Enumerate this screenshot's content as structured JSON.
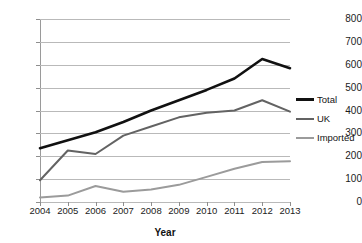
{
  "chart_data": {
    "type": "line",
    "title": "",
    "xlabel": "Year",
    "ylabel": "",
    "grid": true,
    "legend_position": "right",
    "categories": [
      "2004",
      "2005",
      "2006",
      "2007",
      "2008",
      "2009",
      "2010",
      "2011",
      "2012",
      "2013"
    ],
    "x": [
      2004,
      2005,
      2006,
      2007,
      2008,
      2009,
      2010,
      2011,
      2012,
      2013
    ],
    "ylim": [
      0,
      800
    ],
    "yticks": [
      0,
      100,
      200,
      300,
      400,
      500,
      600,
      700,
      800
    ],
    "xticks": [
      "2004",
      "2005",
      "2006",
      "2007",
      "2008",
      "2009",
      "2010",
      "2011",
      "2012",
      "2013"
    ],
    "series": [
      {
        "name": "Total",
        "color": "#111111",
        "width": 2.6,
        "values": [
          235,
          270,
          305,
          350,
          400,
          445,
          490,
          540,
          625,
          585
        ]
      },
      {
        "name": "UK",
        "color": "#636363",
        "width": 2.0,
        "values": [
          95,
          225,
          210,
          290,
          330,
          370,
          390,
          400,
          445,
          395
        ]
      },
      {
        "name": "Imported",
        "color": "#9b9b9b",
        "width": 2.0,
        "values": [
          20,
          28,
          70,
          45,
          55,
          75,
          110,
          145,
          175,
          178
        ]
      }
    ]
  },
  "legend": {
    "items": [
      {
        "label": "Total"
      },
      {
        "label": "UK"
      },
      {
        "label": "Imported"
      }
    ]
  },
  "axes": {
    "x_title": "Year"
  }
}
